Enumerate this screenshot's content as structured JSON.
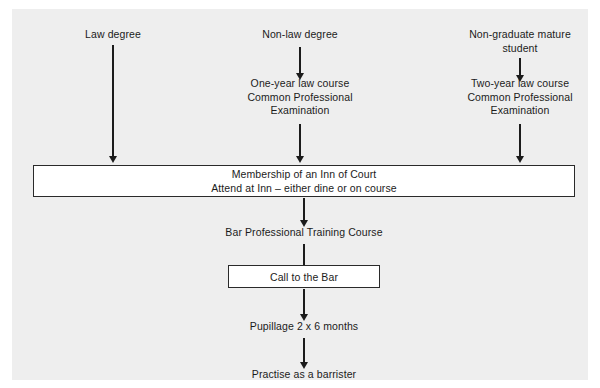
{
  "diagram": {
    "background_color": "#eeeeee",
    "page_color": "#ffffff",
    "line_color": "#1b1b1b",
    "columns": [
      {
        "id": "law-degree",
        "start_label": "Law degree"
      },
      {
        "id": "non-law-degree",
        "start_label": "Non-law degree",
        "second_label": "One-year law course\nCommon Professional\nExamination"
      },
      {
        "id": "non-graduate-mature-student",
        "start_label": "Non-graduate mature\nstudent",
        "second_label": "Two-year law course\nCommon Professional\nExamination"
      }
    ],
    "inn_box": {
      "line1": "Membership of an Inn of Court",
      "line2": "Attend at Inn – either dine or on course"
    },
    "steps": [
      {
        "id": "bar-professional-training-course",
        "label": "Bar Professional Training Course"
      },
      {
        "id": "call-to-the-bar",
        "label": "Call to the Bar"
      },
      {
        "id": "pupillage",
        "label": "Pupillage 2 x 6 months"
      },
      {
        "id": "practise-as-a-barrister",
        "label": "Practise as a barrister"
      }
    ],
    "arrows": [
      {
        "id": "arrow-law-degree-to-inn",
        "name": "down-arrow-icon"
      },
      {
        "id": "arrow-non-law-degree-to-course",
        "name": "down-arrow-icon"
      },
      {
        "id": "arrow-course-to-inn",
        "name": "down-arrow-icon"
      },
      {
        "id": "arrow-mature-student-to-course",
        "name": "down-arrow-icon"
      },
      {
        "id": "arrow-two-year-course-to-inn",
        "name": "down-arrow-icon"
      },
      {
        "id": "arrow-inn-to-bptc",
        "name": "down-arrow-icon"
      },
      {
        "id": "arrow-bptc-to-call",
        "name": "down-arrow-icon"
      },
      {
        "id": "arrow-call-to-pupillage",
        "name": "down-arrow-icon"
      },
      {
        "id": "arrow-pupillage-to-practise",
        "name": "down-arrow-icon"
      }
    ]
  }
}
